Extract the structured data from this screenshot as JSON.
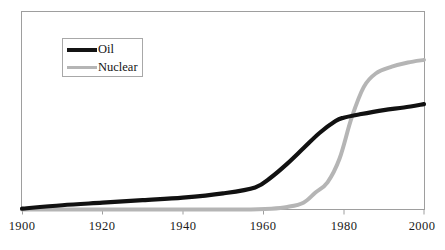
{
  "chart_data": {
    "type": "line",
    "title": "",
    "xlabel": "",
    "ylabel": "",
    "xlim": [
      1900,
      2000
    ],
    "ylim": [
      0,
      100
    ],
    "grid": false,
    "legend_position": "top-left",
    "x_ticks": [
      "1900",
      "1920",
      "1940",
      "1960",
      "1980",
      "2000"
    ],
    "x_tick_values": [
      1900,
      1920,
      1940,
      1960,
      1980,
      2000
    ],
    "y_ticks": [],
    "series": [
      {
        "name": "Oil",
        "color": "#111111",
        "x": [
          1900,
          1910,
          1920,
          1930,
          1940,
          1950,
          1958,
          1962,
          1966,
          1970,
          1974,
          1978,
          1980,
          1984,
          1990,
          1995,
          2000
        ],
        "values": [
          0.5,
          2.5,
          4.0,
          5.5,
          7.0,
          9.5,
          13.0,
          19.0,
          27.0,
          36.0,
          45.0,
          52.0,
          54.0,
          56.0,
          58.5,
          60.0,
          62.0
        ]
      },
      {
        "name": "Nuclear",
        "color": "#b5b5b5",
        "x": [
          1900,
          1920,
          1940,
          1955,
          1962,
          1966,
          1970,
          1973,
          1976,
          1979,
          1982,
          1985,
          1988,
          1992,
          1996,
          2000
        ],
        "values": [
          0,
          0,
          0,
          0,
          0.5,
          1.5,
          4.0,
          10.0,
          16.0,
          30.0,
          54.0,
          72.0,
          80.0,
          84.0,
          86.5,
          88.0
        ]
      }
    ],
    "legend": [
      {
        "label": "Oil",
        "color": "#111111",
        "line_width": "thick"
      },
      {
        "label": "Nuclear",
        "color": "#b5b5b5",
        "line_width": "thin"
      }
    ],
    "axis": {
      "frame_color": "#9a9a9a",
      "baseline_color": "#9a9a9a",
      "tick_color": "#9a9a9a"
    }
  }
}
